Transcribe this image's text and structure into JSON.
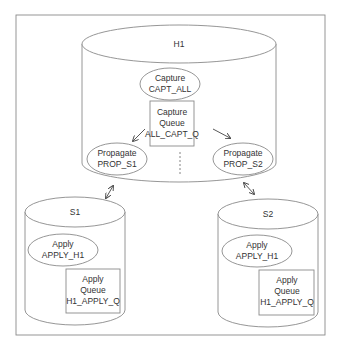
{
  "diagram": {
    "type": "replication-topology",
    "colors": {
      "stroke": "#8a8a8a",
      "text": "#333333",
      "background": "#ffffff"
    },
    "hub": {
      "label": "H1",
      "capture": {
        "line1": "Capture",
        "line2": "CAPT_ALL"
      },
      "capture_queue": {
        "line1": "Capture",
        "line2": "Queue",
        "line3": "ALL_CAPT_Q"
      },
      "propagate_s1": {
        "line1": "Propagate",
        "line2": "PROP_S1"
      },
      "propagate_s2": {
        "line1": "Propagate",
        "line2": "PROP_S2"
      }
    },
    "spokes": [
      {
        "label": "S1",
        "apply": {
          "line1": "Apply",
          "line2": "APPLY_H1"
        },
        "apply_queue": {
          "line1": "Apply",
          "line2": "Queue",
          "line3": "H1_APPLY_Q"
        }
      },
      {
        "label": "S2",
        "apply": {
          "line1": "Apply",
          "line2": "APPLY_H1"
        },
        "apply_queue": {
          "line1": "Apply",
          "line2": "Queue",
          "line3": "H1_APPLY_Q"
        }
      }
    ],
    "connectors": [
      {
        "from": "H1",
        "to": "S1",
        "style": "bidirectional-arrow"
      },
      {
        "from": "H1",
        "to": "S2",
        "style": "bidirectional-arrow"
      },
      {
        "from": "ALL_CAPT_Q",
        "to": "PROP_S1",
        "style": "arrow"
      },
      {
        "from": "ALL_CAPT_Q",
        "to": "PROP_S2",
        "style": "arrow"
      },
      {
        "from": "ALL_CAPT_Q",
        "to": "more",
        "style": "dashed-line"
      }
    ]
  }
}
